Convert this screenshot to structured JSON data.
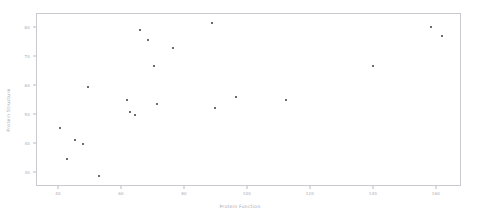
{
  "chart_data": {
    "type": "scatter",
    "title": "",
    "xlabel": "Protein Function",
    "ylabel": "Protein Structure",
    "xlim": [
      33,
      168
    ],
    "ylim": [
      25,
      85
    ],
    "xticks": [
      40,
      60,
      80,
      100,
      120,
      140,
      160
    ],
    "yticks": [
      30,
      40,
      50,
      60,
      70,
      80
    ],
    "grid": false,
    "legend": null,
    "marker_color": "#3a3a44",
    "axis_color": "#c9c9cf",
    "tick_label_color": "#a8a8b2",
    "points": [
      {
        "x": 40.5,
        "y": 45.0
      },
      {
        "x": 43.0,
        "y": 34.5
      },
      {
        "x": 45.5,
        "y": 41.0
      },
      {
        "x": 48.0,
        "y": 39.5
      },
      {
        "x": 49.5,
        "y": 59.5
      },
      {
        "x": 53.0,
        "y": 28.5
      },
      {
        "x": 62.0,
        "y": 55.0
      },
      {
        "x": 63.0,
        "y": 50.5
      },
      {
        "x": 64.5,
        "y": 49.5
      },
      {
        "x": 66.0,
        "y": 79.0
      },
      {
        "x": 68.5,
        "y": 75.5
      },
      {
        "x": 70.5,
        "y": 66.5
      },
      {
        "x": 71.5,
        "y": 53.5
      },
      {
        "x": 76.5,
        "y": 73.0
      },
      {
        "x": 89.0,
        "y": 81.5
      },
      {
        "x": 90.0,
        "y": 52.0
      },
      {
        "x": 96.5,
        "y": 56.0
      },
      {
        "x": 112.5,
        "y": 55.0
      },
      {
        "x": 140.0,
        "y": 66.5
      },
      {
        "x": 158.5,
        "y": 80.0
      },
      {
        "x": 162.0,
        "y": 77.0
      }
    ]
  }
}
